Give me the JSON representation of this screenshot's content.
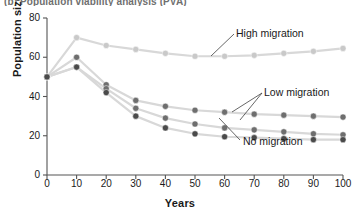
{
  "figure": {
    "clipped_caption": "(b) Population viability analysis (PVA)"
  },
  "axes": {
    "xlabel": "Years",
    "ylabel": "Population size",
    "yticks": [
      "0",
      "20",
      "40",
      "60",
      "80"
    ],
    "xticks": [
      "0",
      "10",
      "20",
      "30",
      "40",
      "50",
      "60",
      "70",
      "80",
      "90",
      "100"
    ]
  },
  "annotations": {
    "high": "High migration",
    "low": "Low migration",
    "none": "No migration"
  },
  "colors": {
    "high_series": "#c9c9c9",
    "low_series": "#6e6e6e",
    "none_series": "#4a4a4a",
    "line": "#d8d8d8",
    "axis": "#555555",
    "text": "#1a1a1a"
  },
  "chart_data": {
    "type": "line",
    "title": "(b) Population viability analysis (PVA)",
    "xlabel": "Years",
    "ylabel": "Population size",
    "xlim": [
      0,
      100
    ],
    "ylim": [
      0,
      80
    ],
    "grid": false,
    "legend_position": "inline-annotations",
    "x": [
      0,
      10,
      20,
      30,
      40,
      50,
      60,
      70,
      80,
      90,
      100
    ],
    "series": [
      {
        "name": "High migration",
        "color": "#c9c9c9",
        "values": [
          50,
          70,
          66,
          64,
          62,
          60.5,
          60.5,
          61,
          62,
          63,
          64.5
        ]
      },
      {
        "name": "Low migration (upper)",
        "color": "#6e6e6e",
        "values": [
          50,
          60,
          46,
          38,
          35,
          33,
          32,
          31,
          30.5,
          30,
          29.5
        ]
      },
      {
        "name": "Low migration (middle)",
        "color": "#6e6e6e",
        "values": [
          50,
          55,
          44,
          34,
          29,
          26,
          24,
          23,
          22,
          21,
          20.5
        ]
      },
      {
        "name": "No migration",
        "color": "#4a4a4a",
        "values": [
          50,
          55,
          42,
          30,
          24,
          21,
          19.5,
          19,
          18.5,
          18,
          18
        ]
      }
    ]
  }
}
